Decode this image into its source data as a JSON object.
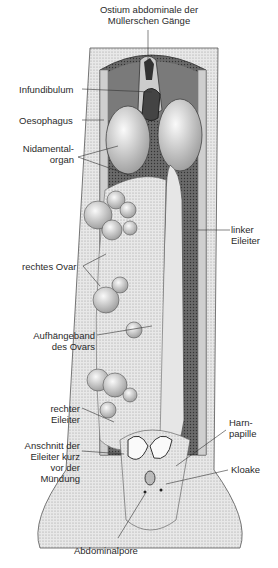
{
  "diagram": {
    "labels": {
      "ostium": [
        "Ostium abdominale der",
        "Müllerschen Gänge"
      ],
      "infundibulum": "Infundibulum",
      "oesophagus": "Oesophagus",
      "nidamental": [
        "Nidamental-",
        "organ"
      ],
      "linker_eileiter": [
        "linker",
        "Eileiter"
      ],
      "rechtes_ovar": "rechtes Ovar",
      "aufhaengeband": [
        "Aufhängeband",
        "des Ovars"
      ],
      "rechter_eileiter": [
        "rechter",
        "Eileiter"
      ],
      "anschnitt": [
        "Anschnitt der",
        "Eileiter kurz",
        "vor der",
        "Mündung"
      ],
      "harnpapille": [
        "Harn-",
        "papille"
      ],
      "kloake": "Kloake",
      "abdominalpore": "Abdominalpore"
    },
    "colors": {
      "ink": "#2a2a2a",
      "shade": "#8a8a8a",
      "light": "#d8d8d8",
      "cavity": "#5a5a5a"
    }
  }
}
